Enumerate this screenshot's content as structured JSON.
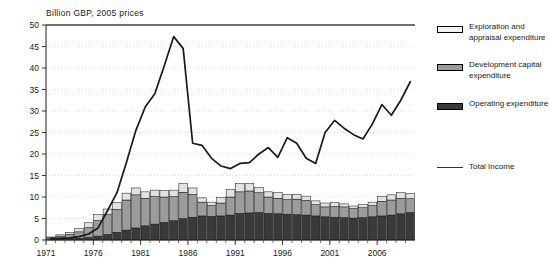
{
  "chart_data": {
    "type": "bar",
    "subtype": "stacked-bar-with-line-overlay",
    "title": "Billion GBP, 2005 prices",
    "xlabel": "",
    "ylabel": "",
    "ylim": [
      0,
      50
    ],
    "ytick_step": 5,
    "yticks": [
      0,
      5,
      10,
      15,
      20,
      25,
      30,
      35,
      40,
      45,
      50
    ],
    "grid": true,
    "grid_axis": "y",
    "legend_position": "right",
    "xlim": [
      1971,
      2009
    ],
    "categories": [
      1971,
      1972,
      1973,
      1974,
      1975,
      1976,
      1977,
      1978,
      1979,
      1980,
      1981,
      1982,
      1983,
      1984,
      1985,
      1986,
      1987,
      1988,
      1989,
      1990,
      1991,
      1992,
      1993,
      1994,
      1995,
      1996,
      1997,
      1998,
      1999,
      2000,
      2001,
      2002,
      2003,
      2004,
      2005,
      2006,
      2007,
      2008,
      2009
    ],
    "xtick_labels": [
      "1971",
      "1976",
      "1981",
      "1986",
      "1991",
      "1996",
      "2001",
      "2006"
    ],
    "xtick_values": [
      1971,
      1976,
      1981,
      1986,
      1991,
      1996,
      2001,
      2006
    ],
    "series": [
      {
        "name": "Operating expenditure",
        "color": "#3a3a3a",
        "stack_order": 1,
        "values": [
          0.1,
          0.2,
          0.3,
          0.4,
          0.6,
          0.9,
          1.3,
          1.8,
          2.3,
          2.8,
          3.3,
          3.7,
          4.1,
          4.5,
          5.0,
          5.3,
          5.6,
          5.5,
          5.6,
          5.8,
          6.2,
          6.3,
          6.4,
          6.2,
          6.1,
          6.0,
          5.9,
          5.8,
          5.6,
          5.4,
          5.3,
          5.2,
          5.1,
          5.2,
          5.4,
          5.6,
          5.8,
          6.1,
          6.4
        ]
      },
      {
        "name": "Development capital expenditure",
        "color": "#9c9c9c",
        "stack_order": 2,
        "values": [
          0.4,
          0.7,
          1.0,
          1.5,
          2.3,
          3.6,
          4.6,
          5.3,
          7.0,
          7.7,
          6.4,
          6.4,
          5.9,
          5.6,
          6.1,
          5.3,
          3.2,
          2.5,
          3.0,
          4.2,
          5.0,
          5.1,
          4.6,
          3.8,
          3.6,
          3.4,
          3.6,
          3.4,
          2.6,
          2.3,
          2.5,
          2.5,
          2.2,
          2.3,
          2.6,
          3.4,
          3.5,
          3.6,
          3.2
        ]
      },
      {
        "name": "Exploration and appraisal expenditure",
        "color": "#e2e2e2",
        "stack_order": 3,
        "values": [
          0.2,
          0.3,
          0.5,
          0.8,
          1.1,
          1.4,
          1.3,
          1.6,
          1.6,
          1.6,
          1.5,
          1.5,
          1.5,
          1.5,
          2.0,
          1.5,
          1.0,
          0.8,
          1.3,
          1.7,
          1.9,
          1.7,
          1.2,
          1.2,
          1.3,
          1.2,
          1.1,
          1.0,
          0.9,
          0.9,
          0.9,
          0.7,
          0.6,
          0.7,
          0.8,
          1.1,
          1.2,
          1.3,
          1.2
        ]
      }
    ],
    "line_series": {
      "name": "Total Income",
      "color": "#1a1a1a",
      "values": [
        0.3,
        0.4,
        0.5,
        0.8,
        1.4,
        2.8,
        6.8,
        11.0,
        18.0,
        25.5,
        31.0,
        34.0,
        40.5,
        47.3,
        44.5,
        22.5,
        22.0,
        19.0,
        17.2,
        16.6,
        17.8,
        18.0,
        20.0,
        21.5,
        19.2,
        23.8,
        22.5,
        19.0,
        17.8,
        25.0,
        27.8,
        26.0,
        24.5,
        23.5,
        27.0,
        31.5,
        29.0,
        32.5,
        36.8
      ]
    },
    "legend_entries": [
      {
        "label": "Exploration and appraisal expenditure",
        "type": "swatch",
        "color": "#f0f0f0"
      },
      {
        "label": "Development capital expenditure",
        "type": "swatch",
        "color": "#9c9c9c"
      },
      {
        "label": "Operating expenditure",
        "type": "swatch",
        "color": "#3a3a3a"
      },
      {
        "label": "Total Income",
        "type": "line",
        "color": "#555555"
      }
    ]
  },
  "legend": {
    "item1": "Exploration and appraisal expenditure",
    "item2": "Development capital expenditure",
    "item3": "Operating expenditure",
    "item4": "Total Income"
  },
  "axis": {
    "y_labels": [
      "50",
      "45",
      "40",
      "35",
      "30",
      "25",
      "20",
      "15",
      "10",
      "5",
      "0"
    ],
    "x_labels": [
      "1971",
      "1976",
      "1981",
      "1986",
      "1991",
      "1996",
      "2001",
      "2006"
    ]
  },
  "title": "Billion GBP, 2005 prices"
}
